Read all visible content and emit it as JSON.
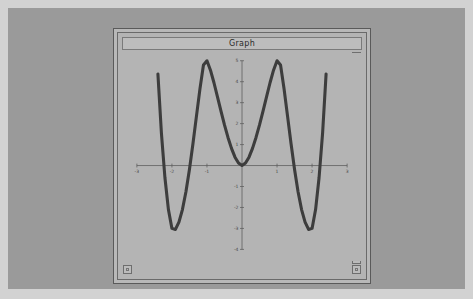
{
  "window": {
    "title": "Graph",
    "widgets": {
      "top_right": "window-menu-box",
      "bottom_left": "resize-handle-box",
      "bottom_right": "resize-handle-box",
      "bottom_right_upper": "scroll-box"
    }
  },
  "colors": {
    "page_background": "#d2d2d2",
    "desktop": "#9a9a9a",
    "window_face": "#b8b8b8",
    "plot_background": "#b4b4b4",
    "curve": "#3d3d3d",
    "axis": "#5d5d5d",
    "tick_text": "#4a4a4a"
  },
  "chart_data": {
    "type": "line",
    "title": "Graph",
    "xlabel": "",
    "ylabel": "",
    "expression": "y = x^4 - 5x^2 + 4",
    "grid": false,
    "legend": null,
    "xlim": [
      -3,
      3
    ],
    "ylim": [
      -4,
      5
    ],
    "xticks": [
      -3,
      -2,
      -1,
      1,
      2,
      3
    ],
    "xtick_labels": [
      "-3",
      "-2",
      "-1",
      "1",
      "2",
      "3"
    ],
    "yticks": [
      -4,
      -3,
      -2,
      -1,
      1,
      2,
      3,
      4,
      5
    ],
    "ytick_labels": [
      "-4",
      "-3",
      "-2",
      "-1",
      "1",
      "2",
      "3",
      "4",
      "5"
    ],
    "roots": [
      -2,
      -1,
      1,
      2
    ],
    "local_maximum": {
      "x": 0,
      "y": 4
    },
    "local_minima": [
      {
        "x": -1.58,
        "y": -2.25
      },
      {
        "x": 1.58,
        "y": -2.25
      }
    ],
    "x": [
      -2.52,
      -2.4,
      -2.3,
      -2.2,
      -2.1,
      -2.0,
      -1.9,
      -1.8,
      -1.7,
      -1.6,
      -1.5,
      -1.4,
      -1.3,
      -1.2,
      -1.1,
      -1.0,
      -0.9,
      -0.8,
      -0.7,
      -0.6,
      -0.5,
      -0.4,
      -0.3,
      -0.2,
      -0.1,
      0.0,
      0.1,
      0.2,
      0.3,
      0.4,
      0.5,
      0.6,
      0.7,
      0.8,
      0.9,
      1.0,
      1.1,
      1.2,
      1.3,
      1.4,
      1.5,
      1.6,
      1.7,
      1.8,
      1.9,
      2.0,
      2.1,
      2.2,
      2.3,
      2.4,
      2.52
    ],
    "y": [
      8.55,
      4.37,
      1.55,
      -0.57,
      -2.1,
      -3.0,
      -3.05,
      -2.7,
      -2.1,
      -1.25,
      -0.19,
      1.04,
      2.36,
      3.66,
      4.8,
      5.0,
      4.55,
      3.95,
      3.28,
      2.6,
      1.94,
      1.34,
      0.82,
      0.4,
      0.12,
      0.0,
      0.12,
      0.4,
      0.82,
      1.34,
      1.94,
      2.6,
      3.28,
      3.95,
      4.55,
      5.0,
      4.8,
      3.66,
      2.36,
      1.04,
      -0.19,
      -1.25,
      -2.1,
      -2.7,
      -3.05,
      -3.0,
      -2.1,
      -0.57,
      1.55,
      4.37,
      8.55
    ]
  }
}
